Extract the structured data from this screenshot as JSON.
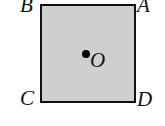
{
  "diagram": {
    "shape": "square",
    "fill_color": "#cfcfcf",
    "stroke_color": "#111111",
    "vertices": [
      {
        "label": "B",
        "position": "top-left"
      },
      {
        "label": "A",
        "position": "top-right"
      },
      {
        "label": "C",
        "position": "bottom-left"
      },
      {
        "label": "D",
        "position": "bottom-right"
      }
    ],
    "center_point": {
      "label": "O",
      "marker": "filled-dot"
    }
  }
}
